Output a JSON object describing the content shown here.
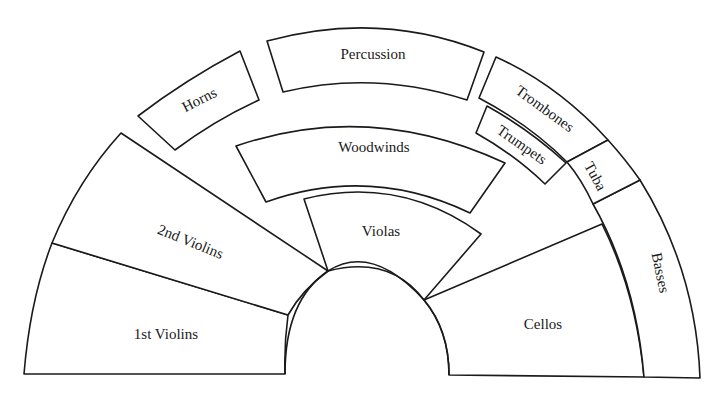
{
  "diagram": {
    "type": "orchestra-seating-chart",
    "colors": {
      "line": "#1a1a1a",
      "background": "#ffffff"
    },
    "sections": [
      {
        "id": "first-violins",
        "label": "1st Violins"
      },
      {
        "id": "second-violins",
        "label": "2nd Violins"
      },
      {
        "id": "violas",
        "label": "Violas"
      },
      {
        "id": "cellos",
        "label": "Cellos"
      },
      {
        "id": "basses",
        "label": "Basses"
      },
      {
        "id": "woodwinds",
        "label": "Woodwinds"
      },
      {
        "id": "horns",
        "label": "Horns"
      },
      {
        "id": "percussion",
        "label": "Percussion"
      },
      {
        "id": "trombones",
        "label": "Trombones"
      },
      {
        "id": "trumpets",
        "label": "Trumpets"
      },
      {
        "id": "tuba",
        "label": "Tuba"
      }
    ]
  }
}
